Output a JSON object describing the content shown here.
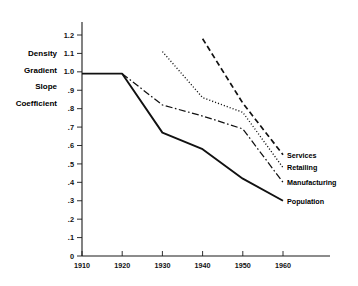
{
  "running_head": "",
  "chart_data": {
    "type": "line",
    "title": "",
    "xlabel": "",
    "ylabel": "Density Gradient Slope Coefficient",
    "ylabel_lines": [
      "Density",
      "Gradient",
      "Slope",
      "Coefficient"
    ],
    "xlim": [
      1910,
      1965
    ],
    "ylim": [
      0,
      1.2
    ],
    "grid": false,
    "legend_position": "right-inline-labels",
    "xticks": [
      1910,
      1920,
      1930,
      1940,
      1950,
      1960
    ],
    "xtick_labels": [
      "1910",
      "1920",
      "1930",
      "1940",
      "1950",
      "1960"
    ],
    "yticks": [
      0,
      0.1,
      0.2,
      0.3,
      0.4,
      0.5,
      0.6,
      0.7,
      0.8,
      0.9,
      1.0,
      1.1,
      1.2
    ],
    "ytick_labels": [
      "0",
      ".1",
      ".2",
      ".3",
      ".4",
      ".5",
      ".6",
      ".7",
      ".8",
      ".9",
      "1.0",
      "1.1",
      "1.2"
    ],
    "series": [
      {
        "name": "Population",
        "label": "Population",
        "style": "solid",
        "dash": "none",
        "width": 1.9,
        "color": "#111111",
        "x": [
          1910,
          1920,
          1930,
          1940,
          1950,
          1960
        ],
        "values": [
          0.99,
          0.99,
          0.67,
          0.58,
          0.42,
          0.3
        ],
        "label_at": {
          "x": 1960,
          "y": 0.3
        }
      },
      {
        "name": "Manufacturing",
        "label": "Manufacturing",
        "style": "dash-dot",
        "dash": "7,2.5,1.6,2.5",
        "width": 1.25,
        "color": "#111111",
        "x": [
          1920,
          1930,
          1940,
          1950,
          1960
        ],
        "values": [
          0.99,
          0.82,
          0.76,
          0.69,
          0.4
        ],
        "label_at": {
          "x": 1960,
          "y": 0.4
        }
      },
      {
        "name": "Retailing",
        "label": "Retailing",
        "style": "dotted",
        "dash": "1.1,2.0",
        "width": 1.35,
        "color": "#111111",
        "x": [
          1930,
          1940,
          1950,
          1960
        ],
        "values": [
          1.11,
          0.86,
          0.78,
          0.48
        ],
        "label_at": {
          "x": 1960,
          "y": 0.48
        }
      },
      {
        "name": "Services",
        "label": "Services",
        "style": "dashed",
        "dash": "5.5,3.2",
        "width": 1.7,
        "color": "#111111",
        "x": [
          1940,
          1950,
          1960
        ],
        "values": [
          1.18,
          0.83,
          0.55
        ],
        "label_at": {
          "x": 1960,
          "y": 0.55
        }
      }
    ]
  }
}
